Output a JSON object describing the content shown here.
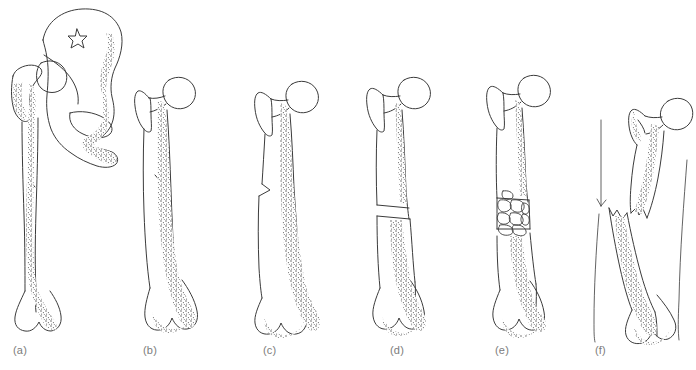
{
  "figure": {
    "domain_kind": "anatomical-line-illustration",
    "background_color": "#ffffff",
    "ink_color": "#3b3b3b",
    "stipple_color": "#555555",
    "label_color": "#7c7c7c",
    "width": 696,
    "height": 370,
    "scan_artifact_text": ""
  },
  "panels": [
    {
      "id": "a",
      "label": "(a)",
      "label_x": 13,
      "label_y": 351,
      "caption_text": "(a)",
      "description": "Intact femur articulating with hemipelvis, showing ilium, acetabulum, obturator foramen and star-shaped marking",
      "fracture_type": "none-with-pelvis"
    },
    {
      "id": "b",
      "label": "(b)",
      "label_x": 143,
      "label_y": 351,
      "caption_text": "(b)",
      "description": "Intact femur, head, neck, greater trochanter, shaft and distal condyles",
      "fracture_type": "none"
    },
    {
      "id": "c",
      "label": "(c)",
      "label_x": 263,
      "label_y": 351,
      "caption_text": "(c)",
      "description": "Femur with incomplete fissure crack in medial mid-shaft cortex",
      "fracture_type": "incomplete-fissure"
    },
    {
      "id": "d",
      "label": "(d)",
      "label_x": 390,
      "label_y": 351,
      "caption_text": "(d)",
      "description": "Femur with complete transverse fracture across mid-shaft",
      "fracture_type": "complete-transverse"
    },
    {
      "id": "e",
      "label": "(e)",
      "label_x": 495,
      "label_y": 351,
      "caption_text": "(e)",
      "description": "Femur with comminuted mid-shaft fracture producing multiple small bone fragments",
      "fracture_type": "comminuted"
    },
    {
      "id": "f",
      "label": "(f)",
      "label_x": 595,
      "label_y": 351,
      "caption_text": "(f)",
      "description": "Femur with severely displaced and angulated fracture, proximal and distal fragments overriding, with vertical reference lines",
      "fracture_type": "displaced-angulated"
    }
  ]
}
